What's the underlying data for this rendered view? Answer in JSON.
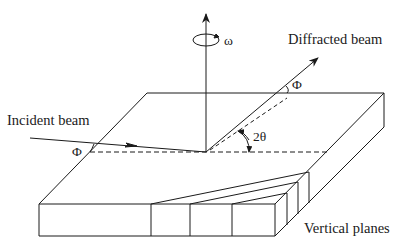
{
  "diagram": {
    "title": "",
    "labels": {
      "incident_beam": "Incident beam",
      "diffracted_beam": "Diffracted beam",
      "vertical_planes": "Vertical planes",
      "omega": "ω",
      "phi_incident": "Φ",
      "phi_diffracted": "Φ",
      "two_theta": "2θ"
    },
    "colors": {
      "line": "#1a1a1a",
      "background": "#ffffff"
    },
    "elements": [
      "sample-slab",
      "rotation-axis",
      "incident-beam",
      "diffracted-beam",
      "vertical-planes-wedge"
    ]
  }
}
